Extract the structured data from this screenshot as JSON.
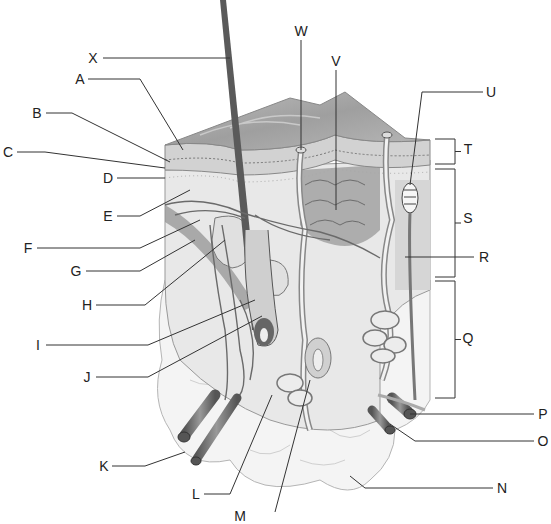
{
  "diagram": {
    "labels": [
      {
        "id": "X",
        "text": "X",
        "x": 93,
        "y": 58,
        "line": [
          [
            103,
            58
          ],
          [
            230,
            58
          ]
        ]
      },
      {
        "id": "A",
        "text": "A",
        "x": 80,
        "y": 79,
        "line": [
          [
            88,
            79
          ],
          [
            140,
            79
          ],
          [
            183,
            150
          ]
        ]
      },
      {
        "id": "B",
        "text": "B",
        "x": 37,
        "y": 113,
        "line": [
          [
            46,
            113
          ],
          [
            72,
            113
          ],
          [
            170,
            162
          ]
        ]
      },
      {
        "id": "C",
        "text": "C",
        "x": 8,
        "y": 152,
        "line": [
          [
            17,
            152
          ],
          [
            45,
            152
          ],
          [
            165,
            168
          ]
        ]
      },
      {
        "id": "D",
        "text": "D",
        "x": 108,
        "y": 178,
        "line": [
          [
            117,
            178
          ],
          [
            165,
            178
          ]
        ]
      },
      {
        "id": "E",
        "text": "E",
        "x": 108,
        "y": 216,
        "line": [
          [
            117,
            216
          ],
          [
            140,
            216
          ],
          [
            190,
            190
          ]
        ]
      },
      {
        "id": "F",
        "text": "F",
        "x": 28,
        "y": 248,
        "line": [
          [
            37,
            248
          ],
          [
            140,
            248
          ],
          [
            200,
            220
          ]
        ]
      },
      {
        "id": "G",
        "text": "G",
        "x": 76,
        "y": 271,
        "line": [
          [
            86,
            271
          ],
          [
            140,
            271
          ],
          [
            195,
            240
          ]
        ]
      },
      {
        "id": "H",
        "text": "H",
        "x": 87,
        "y": 305,
        "line": [
          [
            96,
            305
          ],
          [
            145,
            305
          ],
          [
            225,
            240
          ]
        ]
      },
      {
        "id": "I",
        "text": "I",
        "x": 38,
        "y": 345,
        "line": [
          [
            46,
            345
          ],
          [
            148,
            345
          ],
          [
            255,
            300
          ]
        ]
      },
      {
        "id": "J",
        "text": "J",
        "x": 87,
        "y": 377,
        "line": [
          [
            96,
            377
          ],
          [
            148,
            377
          ],
          [
            262,
            316
          ]
        ]
      },
      {
        "id": "K",
        "text": "K",
        "x": 104,
        "y": 466,
        "line": [
          [
            112,
            466
          ],
          [
            145,
            466
          ],
          [
            185,
            452
          ]
        ]
      },
      {
        "id": "L",
        "text": "L",
        "x": 196,
        "y": 494,
        "line": [
          [
            204,
            494
          ],
          [
            230,
            494
          ],
          [
            272,
            395
          ]
        ]
      },
      {
        "id": "M",
        "text": "M",
        "x": 240,
        "y": 516,
        "line": [
          [
            275,
            512
          ],
          [
            310,
            380
          ]
        ]
      },
      {
        "id": "N",
        "text": "N",
        "x": 502,
        "y": 488,
        "line": [
          [
            493,
            488
          ],
          [
            365,
            488
          ],
          [
            350,
            476
          ]
        ]
      },
      {
        "id": "O",
        "text": "O",
        "x": 543,
        "y": 441,
        "line": [
          [
            534,
            441
          ],
          [
            415,
            441
          ],
          [
            390,
            424
          ]
        ]
      },
      {
        "id": "P",
        "text": "P",
        "x": 543,
        "y": 414,
        "line": [
          [
            534,
            414
          ],
          [
            410,
            414
          ]
        ]
      },
      {
        "id": "Q",
        "text": "Q",
        "x": 468,
        "y": 338,
        "line": []
      },
      {
        "id": "R",
        "text": "R",
        "x": 484,
        "y": 257,
        "line": [
          [
            474,
            257
          ],
          [
            405,
            257
          ]
        ]
      },
      {
        "id": "S",
        "text": "S",
        "x": 468,
        "y": 218,
        "line": []
      },
      {
        "id": "T",
        "text": "T",
        "x": 468,
        "y": 149,
        "line": []
      },
      {
        "id": "U",
        "text": "U",
        "x": 491,
        "y": 92,
        "line": [
          [
            483,
            92
          ],
          [
            422,
            92
          ],
          [
            410,
            185
          ]
        ]
      },
      {
        "id": "V",
        "text": "V",
        "x": 336,
        "y": 61,
        "line": [
          [
            336,
            70
          ],
          [
            336,
            210
          ]
        ]
      },
      {
        "id": "W",
        "text": "W",
        "x": 301,
        "y": 31,
        "line": [
          [
            301,
            40
          ],
          [
            301,
            150
          ]
        ]
      }
    ],
    "brackets": [
      {
        "id": "T",
        "top": 139,
        "bottom": 164,
        "x": 455
      },
      {
        "id": "S",
        "top": 169,
        "bottom": 277,
        "x": 455
      },
      {
        "id": "Q",
        "top": 281,
        "bottom": 398,
        "x": 455
      }
    ],
    "colors": {
      "ink": "#333333",
      "hair": "#5a5a5a",
      "epidermis": "#c8c8c8",
      "dermis": "#e6e6e6",
      "hypodermis": "#f2f2f2",
      "vessel": "#8a8a8a",
      "gland": "#d8d8d8"
    }
  }
}
